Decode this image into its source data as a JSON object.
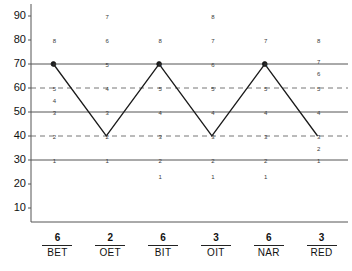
{
  "chart_data": {
    "type": "line",
    "title": "",
    "xlabel": "",
    "ylabel": "",
    "ylim": [
      5,
      95
    ],
    "yticks": [
      90,
      80,
      70,
      60,
      50,
      40,
      30,
      20,
      10
    ],
    "grid": {
      "solid_lines": [
        70,
        50,
        30
      ],
      "dashed_lines": [
        60,
        40
      ],
      "position": "horizontal"
    },
    "categories": [
      "BET",
      "OET",
      "BIT",
      "OIT",
      "NAR",
      "RED"
    ],
    "category_counts": [
      6,
      2,
      6,
      3,
      6,
      3
    ],
    "series": [
      {
        "name": "profile",
        "values": [
          70,
          40,
          70,
          40,
          70,
          40
        ],
        "marker": "dot"
      }
    ],
    "columns": [
      {
        "label": "BET",
        "count": 6,
        "marks": [
          {
            "y": 80,
            "text": "8"
          },
          {
            "y": 70,
            "text": "6"
          },
          {
            "y": 60,
            "text": "5"
          },
          {
            "y": 55,
            "text": "4"
          },
          {
            "y": 50,
            "text": "3"
          },
          {
            "y": 40,
            "text": "2"
          },
          {
            "y": 30,
            "text": "1"
          }
        ]
      },
      {
        "label": "OET",
        "count": 2,
        "marks": [
          {
            "y": 90,
            "text": "7"
          },
          {
            "y": 80,
            "text": "6"
          },
          {
            "y": 70,
            "text": "5"
          },
          {
            "y": 60,
            "text": "4"
          },
          {
            "y": 50,
            "text": "3"
          },
          {
            "y": 40,
            "text": "2"
          },
          {
            "y": 30,
            "text": "1"
          }
        ]
      },
      {
        "label": "BIT",
        "count": 6,
        "marks": [
          {
            "y": 80,
            "text": "8"
          },
          {
            "y": 70,
            "text": "6"
          },
          {
            "y": 60,
            "text": "5"
          },
          {
            "y": 50,
            "text": "4"
          },
          {
            "y": 40,
            "text": "3"
          },
          {
            "y": 30,
            "text": "2"
          },
          {
            "y": 23,
            "text": "1"
          }
        ]
      },
      {
        "label": "OIT",
        "count": 3,
        "marks": [
          {
            "y": 90,
            "text": "8"
          },
          {
            "y": 80,
            "text": "7"
          },
          {
            "y": 70,
            "text": "6"
          },
          {
            "y": 60,
            "text": "5"
          },
          {
            "y": 50,
            "text": "4"
          },
          {
            "y": 40,
            "text": "3"
          },
          {
            "y": 30,
            "text": "2"
          },
          {
            "y": 23,
            "text": "1"
          }
        ]
      },
      {
        "label": "NAR",
        "count": 6,
        "marks": [
          {
            "y": 80,
            "text": "7"
          },
          {
            "y": 70,
            "text": "6"
          },
          {
            "y": 60,
            "text": "5"
          },
          {
            "y": 50,
            "text": "4"
          },
          {
            "y": 40,
            "text": "3"
          },
          {
            "y": 30,
            "text": "2"
          },
          {
            "y": 23,
            "text": "1"
          }
        ]
      },
      {
        "label": "RED",
        "count": 3,
        "marks": [
          {
            "y": 80,
            "text": "8"
          },
          {
            "y": 71,
            "text": "7"
          },
          {
            "y": 66,
            "text": "6"
          },
          {
            "y": 60,
            "text": "5"
          },
          {
            "y": 50,
            "text": "4"
          },
          {
            "y": 40,
            "text": "3"
          },
          {
            "y": 35,
            "text": "2"
          },
          {
            "y": 30,
            "text": "1"
          }
        ]
      }
    ],
    "colors": {
      "line": "#1a1a1a",
      "solid_grid": "#555555",
      "dashed_grid": "#777777",
      "axis": "#555555",
      "text": "#111111",
      "background": "#ffffff"
    }
  }
}
